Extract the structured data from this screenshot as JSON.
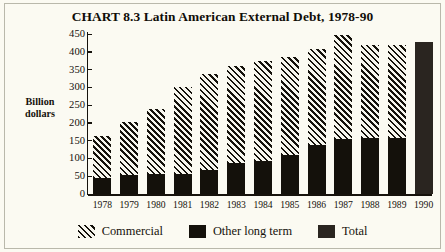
{
  "frame": {
    "background_color": "#fbfaf2",
    "border_color": "#b9b8ab"
  },
  "axis_title": "Billion\ndollars",
  "axis_title_line1": "Billion",
  "axis_title_line2": "dollars",
  "legend": {
    "items": [
      {
        "label": "Commercial",
        "swatch": "diagonal-hatch",
        "color": "#14110b"
      },
      {
        "label": "Other long term",
        "swatch": "solid",
        "color": "#14110b"
      },
      {
        "label": "Total",
        "swatch": "solid",
        "color": "#2a2520"
      }
    ]
  },
  "chart_data": {
    "type": "bar",
    "subtype": "stacked",
    "title": "CHART 8.3  Latin American External Debt, 1978-90",
    "xlabel": "",
    "ylabel": "Billion dollars",
    "ylim": [
      0,
      450
    ],
    "yticks": [
      0,
      50,
      100,
      150,
      200,
      250,
      300,
      350,
      400,
      450
    ],
    "grid": false,
    "legend_position": "bottom",
    "categories": [
      "1978",
      "1979",
      "1980",
      "1981",
      "1982",
      "1983",
      "1984",
      "1985",
      "1986",
      "1987",
      "1988",
      "1989",
      "1990"
    ],
    "series": [
      {
        "name": "Other long term",
        "color": "#14110b",
        "values": [
          45,
          53,
          55,
          57,
          68,
          87,
          93,
          110,
          137,
          155,
          158,
          158,
          null
        ]
      },
      {
        "name": "Commercial",
        "color": "#14110b",
        "pattern": "diagonal-hatch",
        "values": [
          118,
          150,
          185,
          245,
          270,
          273,
          282,
          275,
          270,
          292,
          262,
          260,
          null
        ]
      },
      {
        "name": "Total",
        "color": "#2a2520",
        "values": [
          null,
          null,
          null,
          null,
          null,
          null,
          null,
          null,
          null,
          null,
          null,
          null,
          427
        ]
      }
    ],
    "totals": [
      163,
      203,
      240,
      302,
      338,
      360,
      375,
      385,
      407,
      447,
      420,
      418,
      427
    ]
  }
}
